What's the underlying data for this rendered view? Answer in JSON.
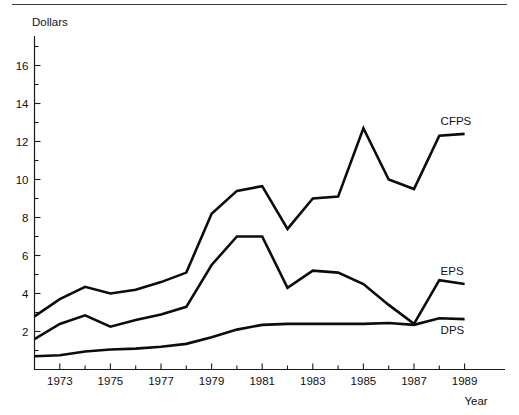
{
  "chart_data": {
    "type": "line",
    "title": "",
    "xlabel": "Year",
    "ylabel": "Dollars",
    "xlim": [
      1972,
      1989
    ],
    "ylim": [
      0,
      17
    ],
    "grid": false,
    "legend_position": "right-inline-end-of-line",
    "y_ticks_major": [
      2,
      4,
      6,
      8,
      10,
      12,
      14,
      16
    ],
    "y_tick_labels": [
      "2",
      "4",
      "6",
      "8",
      "10",
      "12",
      "14",
      "16"
    ],
    "y_ticks_minor": [
      1,
      3,
      5,
      7,
      9,
      11,
      13,
      15,
      17
    ],
    "x_ticks_major": [
      1973,
      1975,
      1977,
      1979,
      1981,
      1983,
      1985,
      1987,
      1989
    ],
    "x_tick_labels": [
      "1973",
      "1975",
      "1977",
      "1979",
      "1981",
      "1983",
      "1985",
      "1987",
      "1989"
    ],
    "x_ticks_minor": [
      1974,
      1976,
      1978,
      1980,
      1982,
      1984,
      1986,
      1988
    ],
    "x": [
      1972,
      1973,
      1974,
      1975,
      1976,
      1977,
      1978,
      1979,
      1980,
      1981,
      1982,
      1983,
      1984,
      1985,
      1986,
      1987,
      1988,
      1989
    ],
    "series": [
      {
        "name": "CFPS",
        "label": "CFPS",
        "color": "#0c0c0c",
        "values": [
          2.8,
          3.7,
          4.35,
          4.0,
          4.2,
          4.6,
          5.1,
          8.2,
          9.4,
          9.65,
          7.4,
          9.0,
          9.1,
          12.7,
          10.0,
          9.5,
          12.3,
          12.4
        ]
      },
      {
        "name": "EPS",
        "label": "EPS",
        "color": "#0c0c0c",
        "values": [
          1.6,
          2.4,
          2.85,
          2.25,
          2.6,
          2.9,
          3.3,
          5.5,
          7.0,
          7.0,
          4.3,
          5.2,
          5.1,
          4.5,
          3.4,
          2.4,
          4.7,
          4.5
        ]
      },
      {
        "name": "DPS",
        "label": "DPS",
        "color": "#0c0c0c",
        "values": [
          0.7,
          0.75,
          0.95,
          1.05,
          1.1,
          1.2,
          1.35,
          1.7,
          2.1,
          2.35,
          2.4,
          2.4,
          2.4,
          2.4,
          2.45,
          2.35,
          2.7,
          2.65
        ]
      }
    ]
  },
  "axis": {
    "y_title": "Dollars",
    "x_title": "Year"
  }
}
